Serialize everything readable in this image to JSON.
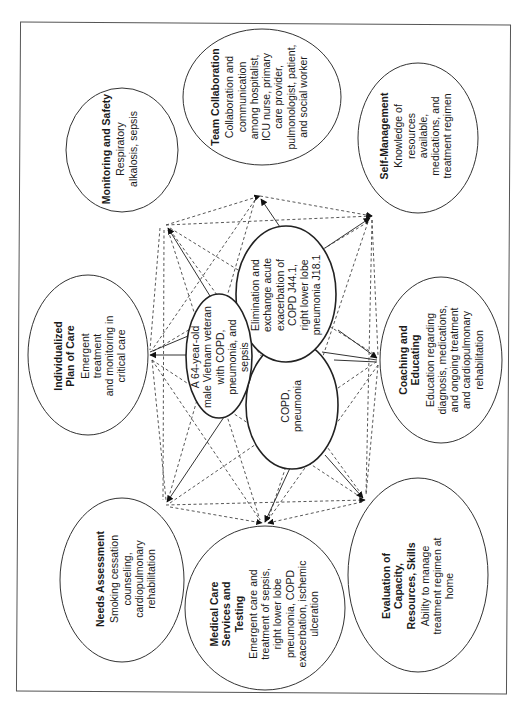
{
  "diagram": {
    "orientation": "rotated -90deg (landscape figure on portrait page)",
    "center_nodes": {
      "patient": {
        "lines": [
          "A 64-year-old",
          "male Vietnam veteran",
          "with COPD,",
          "pneumonia, and",
          "sepsis"
        ]
      },
      "nursing_diagnosis": {
        "lines": [
          "Elimination and",
          "exchange acute",
          "exacerbation of",
          "COPD J44.1,",
          "right lower lobe",
          "pneumonia J18.1"
        ]
      },
      "medical_diagnosis": {
        "lines": [
          "COPD,",
          "pneumonia"
        ]
      }
    },
    "outer_nodes": [
      {
        "id": "monitoring",
        "title": "Monitoring and Safety",
        "body": [
          "Respiratory",
          "alkalosis, sepsis"
        ]
      },
      {
        "id": "team",
        "title": "Team Collaboration",
        "body": [
          "Collaboration and",
          "communication",
          "among hospitalist,",
          "ICU nurse, primary",
          "care provider,",
          "pulmonologist, patient,",
          "and social worker"
        ]
      },
      {
        "id": "selfmgmt",
        "title": "Self-Management",
        "body": [
          "Knowledge of",
          "resources",
          "available,",
          "medications, and",
          "treatment regimen"
        ]
      },
      {
        "id": "plan",
        "title": "Individualized Plan of Care",
        "title_lines": [
          "Individualized",
          "Plan of Care"
        ],
        "body": [
          "Emergent",
          "treatment",
          "and monitoring in",
          "critical care"
        ]
      },
      {
        "id": "coaching",
        "title": "Coaching and Educating",
        "title_lines": [
          "Coaching and",
          "Educating"
        ],
        "body": [
          "Education regarding",
          "diagnosis, medications,",
          "and ongoing treatment",
          "and cardiopulmonary",
          "rehabilitation"
        ]
      },
      {
        "id": "needs",
        "title": "Needs Assessment",
        "body": [
          "Smoking cessation",
          "counseling,",
          "cardiopulmonary",
          "rehabilitation"
        ]
      },
      {
        "id": "medical",
        "title": "Medical Care Services and Testing",
        "title_lines": [
          "Medical Care",
          "Services and",
          "Testing"
        ],
        "body": [
          "Emergent care and",
          "treatment of sepsis,",
          "right lower lobe",
          "pneumonia, COPD",
          "exacerbation, ischemic",
          "ulceration"
        ]
      },
      {
        "id": "evaluation",
        "title": "Evaluation of Capacity, Resources, Skills",
        "title_lines": [
          "Evaluation of",
          "Capacity,",
          "Resources, Skills"
        ],
        "body": [
          "Ability to manage",
          "treatment regimen at",
          "home"
        ]
      }
    ],
    "edges": {
      "solid": "center nodes to each outer node (arrow)",
      "dashed": "outer nodes interconnected to each other (arrow)"
    },
    "colors": {
      "line": "#333333",
      "background": "#ffffff",
      "text": "#1a1a1a"
    }
  }
}
